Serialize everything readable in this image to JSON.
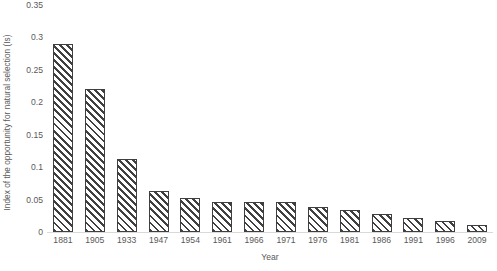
{
  "chart_data": {
    "type": "bar",
    "title": "",
    "xlabel": "Year",
    "ylabel": "Index of the opportunity for natural selection  (Is)",
    "categories": [
      "1881",
      "1905",
      "1933",
      "1947",
      "1954",
      "1961",
      "1966",
      "1971",
      "1976",
      "1981",
      "1986",
      "1991",
      "1996",
      "2009"
    ],
    "values": [
      0.29,
      0.22,
      0.112,
      0.063,
      0.052,
      0.047,
      0.047,
      0.046,
      0.038,
      0.034,
      0.028,
      0.022,
      0.017,
      0.011
    ],
    "ylim": [
      0,
      0.35
    ],
    "yticks": [
      "0",
      "0.05",
      "0.1",
      "0.15",
      "0.2",
      "0.25",
      "0.3",
      "0.35"
    ],
    "ytick_values": [
      0,
      0.05,
      0.1,
      0.15,
      0.2,
      0.25,
      0.3,
      0.35
    ],
    "grid": false,
    "legend": null,
    "bar_fill": "hatch-diagonal",
    "bar_border_color": "#3f3f3f",
    "axis_color": "#d9d9d9",
    "text_color": "#595959"
  }
}
